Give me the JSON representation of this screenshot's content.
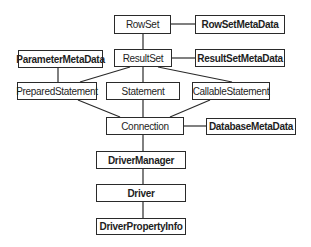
{
  "diagram": {
    "title": "",
    "nodes": [
      {
        "id": "rowset",
        "label": "RowSet",
        "bold": false,
        "x": 114,
        "y": 15,
        "w": 57,
        "h": 19
      },
      {
        "id": "rowsetmetadata",
        "label": "RowSetMetaData",
        "bold": true,
        "x": 195,
        "y": 15,
        "w": 90,
        "h": 19
      },
      {
        "id": "resultset",
        "label": "ResultSet",
        "bold": false,
        "x": 114,
        "y": 49,
        "w": 58,
        "h": 18
      },
      {
        "id": "resultsetmetadata",
        "label": "ResultSetMetaData",
        "bold": true,
        "x": 195,
        "y": 49,
        "w": 90,
        "h": 18
      },
      {
        "id": "parametermetadata",
        "label": "ParameterMetaData",
        "bold": true,
        "x": 18,
        "y": 50,
        "w": 85,
        "h": 18
      },
      {
        "id": "preparedstatement",
        "label": "PreparedStatement",
        "bold": false,
        "x": 17,
        "y": 82,
        "w": 80,
        "h": 18
      },
      {
        "id": "statement",
        "label": "Statement",
        "bold": false,
        "x": 106,
        "y": 82,
        "w": 74,
        "h": 18
      },
      {
        "id": "callablestatement",
        "label": "CallableStatement",
        "bold": false,
        "x": 192,
        "y": 82,
        "w": 78,
        "h": 18
      },
      {
        "id": "connection",
        "label": "Connection",
        "bold": false,
        "x": 106,
        "y": 117,
        "w": 78,
        "h": 18
      },
      {
        "id": "databasemetadata",
        "label": "DatabaseMetaData",
        "bold": true,
        "x": 206,
        "y": 118,
        "w": 90,
        "h": 17
      },
      {
        "id": "drivermanager",
        "label": "DriverManager",
        "bold": true,
        "x": 96,
        "y": 151,
        "w": 90,
        "h": 18
      },
      {
        "id": "driver",
        "label": "Driver",
        "bold": true,
        "x": 96,
        "y": 184,
        "w": 90,
        "h": 18
      },
      {
        "id": "driverpropertyinfo",
        "label": "DriverPropertyInfo",
        "bold": true,
        "x": 96,
        "y": 218,
        "w": 90,
        "h": 17
      }
    ],
    "edges": [
      [
        "rowset",
        "rowsetmetadata"
      ],
      [
        "rowset",
        "resultset"
      ],
      [
        "resultset",
        "resultsetmetadata"
      ],
      [
        "parametermetadata",
        "preparedstatement"
      ],
      [
        "resultset",
        "preparedstatement"
      ],
      [
        "resultset",
        "statement"
      ],
      [
        "resultset",
        "callablestatement"
      ],
      [
        "preparedstatement",
        "connection"
      ],
      [
        "statement",
        "connection"
      ],
      [
        "callablestatement",
        "connection"
      ],
      [
        "connection",
        "databasemetadata"
      ],
      [
        "connection",
        "drivermanager"
      ],
      [
        "drivermanager",
        "driver"
      ],
      [
        "driver",
        "driverpropertyinfo"
      ]
    ],
    "colors": {
      "line": "#2a2a2a",
      "box_border": "#2a2a2a",
      "text": "#1e1e1e",
      "background": "#ffffff"
    }
  }
}
